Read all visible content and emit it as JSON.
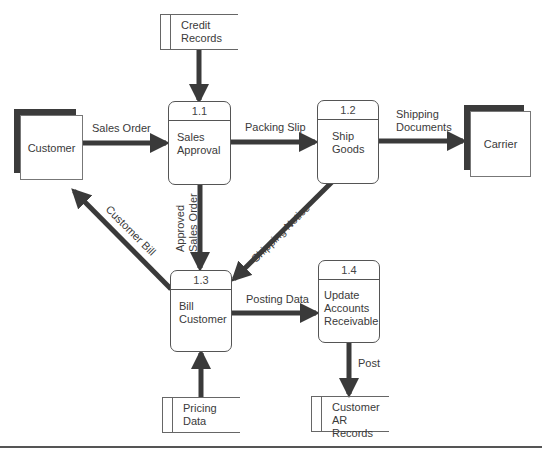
{
  "diagram": {
    "type": "data-flow-diagram",
    "colors": {
      "arrow": "#3a3a3a",
      "shadow": "#3b3b3b",
      "border": "#555555"
    },
    "processes": [
      {
        "id": "1.1",
        "name_line1": "Sales",
        "name_line2": "Approval"
      },
      {
        "id": "1.2",
        "name_line1": "Ship",
        "name_line2": "Goods"
      },
      {
        "id": "1.3",
        "name_line1": "Bill",
        "name_line2": "Customer"
      },
      {
        "id": "1.4",
        "name_line1": "Update",
        "name_line2": "Accounts",
        "name_line3": "Receivable"
      }
    ],
    "entities": [
      {
        "name": "Customer"
      },
      {
        "name": "Carrier"
      }
    ],
    "stores": [
      {
        "line1": "Credit",
        "line2": "Records"
      },
      {
        "line1": "Pricing",
        "line2": "Data"
      },
      {
        "line1": "Customer",
        "line2": "AR Records"
      }
    ],
    "flows": {
      "sales_order": "Sales Order",
      "packing_slip": "Packing Slip",
      "shipping_documents_1": "Shipping",
      "shipping_documents_2": "Documents",
      "approved_sales_order_1": "Approved",
      "approved_sales_order_2": "Sales Order",
      "customer_bill": "Customer Bill",
      "shipping_notice": "Shipping Notice",
      "posting_data": "Posting Data",
      "post": "Post"
    }
  }
}
